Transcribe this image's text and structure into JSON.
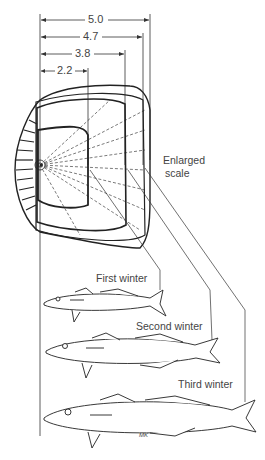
{
  "diagram": {
    "scale_label_line1": "Enlarged",
    "scale_label_line2": "scale",
    "measurements": [
      {
        "label": "5.0",
        "value": 5.0
      },
      {
        "label": "4.7",
        "value": 4.7
      },
      {
        "label": "3.8",
        "value": 3.8
      },
      {
        "label": "2.2",
        "value": 2.2
      }
    ],
    "stages": [
      {
        "label": "First winter"
      },
      {
        "label": "Second winter"
      },
      {
        "label": "Third winter"
      }
    ],
    "signature": "MK"
  }
}
